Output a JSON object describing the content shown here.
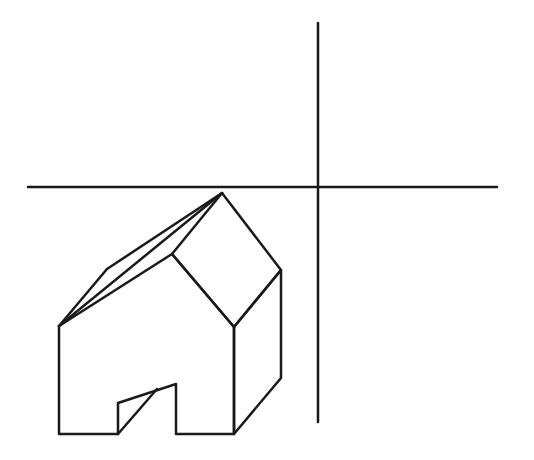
{
  "diagram": {
    "type": "line-drawing",
    "stroke_color": "#1a1a1a",
    "background": "#ffffff",
    "stroke_width": 2.5,
    "axes": {
      "horizontal": {
        "x1": 28,
        "y1": 187,
        "x2": 497,
        "y2": 187
      },
      "vertical": {
        "x1": 318,
        "y1": 23,
        "x2": 318,
        "y2": 422
      }
    },
    "house": {
      "front_face": "59,434 118,434 118,403 176,384 176,434 234,434 234,327 172,254 59,326",
      "right_wall": "234,327 281,270 281,378 234,434",
      "roof_right": "172,254 222,193 281,270 234,327",
      "roof_left": "59,326 107,269 222,193",
      "ridge_left_edge": "59,326 222,193",
      "door_inner_edge": "118,434 157,389"
    }
  }
}
